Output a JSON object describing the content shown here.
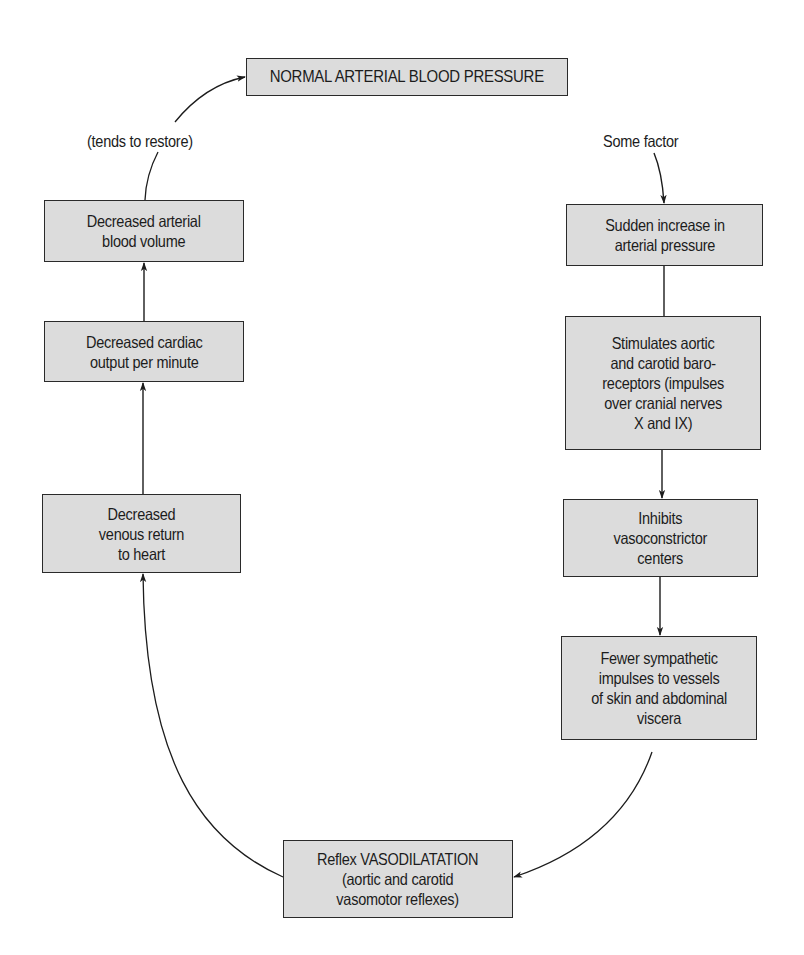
{
  "diagram": {
    "type": "flowchart-cycle",
    "colors": {
      "box_fill": "#dcdcdc",
      "box_border": "#2a2a2a",
      "line": "#1c1c1c",
      "background": "#ffffff"
    },
    "nodes": {
      "normal": {
        "text": "NORMAL ARTERIAL BLOOD PRESSURE"
      },
      "dec_volume": {
        "text": "Decreased arterial\nblood volume"
      },
      "dec_cardiac": {
        "text": "Decreased cardiac\noutput per minute"
      },
      "dec_venous": {
        "text": "Decreased\nvenous return\nto heart"
      },
      "sudden": {
        "text": "Sudden increase in\narterial pressure"
      },
      "stimulates": {
        "text": "Stimulates aortic\nand carotid baro-\nreceptors (impulses\nover cranial nerves\nX and IX)"
      },
      "inhibits": {
        "text": "Inhibits\nvasoconstrictor\ncenters"
      },
      "fewer": {
        "text": "Fewer sympathetic\nimpulses to vessels\nof skin and abdominal\nviscera"
      },
      "reflex": {
        "text": "Reflex VASODILATATION\n(aortic and carotid\nvasomotor reflexes)"
      }
    },
    "labels": {
      "restore": "(tends to restore)",
      "factor": "Some factor"
    },
    "edges": [
      {
        "from": "factor",
        "to": "sudden"
      },
      {
        "from": "sudden",
        "to": "stimulates"
      },
      {
        "from": "stimulates",
        "to": "inhibits"
      },
      {
        "from": "inhibits",
        "to": "fewer"
      },
      {
        "from": "fewer",
        "to": "reflex"
      },
      {
        "from": "reflex",
        "to": "dec_venous"
      },
      {
        "from": "dec_venous",
        "to": "dec_cardiac"
      },
      {
        "from": "dec_cardiac",
        "to": "dec_volume"
      },
      {
        "from": "dec_volume",
        "to": "normal",
        "label": "(tends to restore)"
      }
    ]
  }
}
